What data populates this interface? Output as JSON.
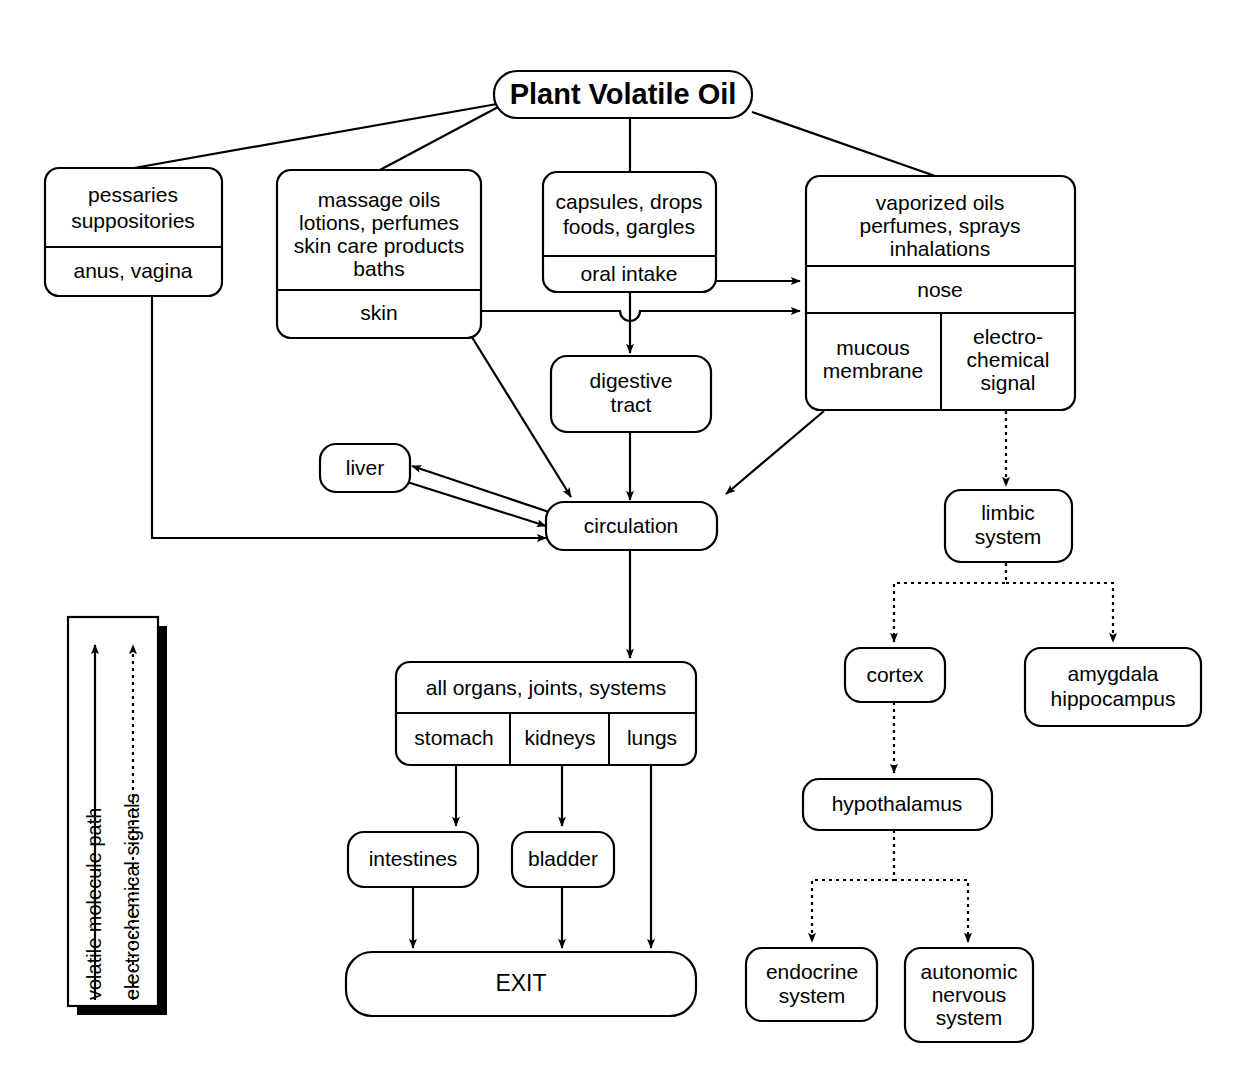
{
  "title": "Plant Volatile Oil",
  "nodes": {
    "root": {
      "label": "Plant Volatile Oil"
    },
    "pessaries": {
      "line1": "pessaries",
      "line2": "suppositories",
      "route": "anus, vagina"
    },
    "massage": {
      "line1": "massage oils",
      "line2": "lotions, perfumes",
      "line3": "skin care products",
      "line4": "baths",
      "route": "skin"
    },
    "capsules": {
      "line1": "capsules, drops",
      "line2": "foods, gargles",
      "route": "oral intake"
    },
    "vaporized": {
      "line1": "vaporized oils",
      "line2": "perfumes, sprays",
      "line3": "inhalations",
      "route": "nose",
      "sub_left1": "mucous",
      "sub_left2": "membrane",
      "sub_right1": "electro-",
      "sub_right2": "chemical",
      "sub_right3": "signal"
    },
    "digestive": {
      "line1": "digestive",
      "line2": "tract"
    },
    "liver": {
      "label": "liver"
    },
    "circulation": {
      "label": "circulation"
    },
    "organs": {
      "header": "all organs, joints, systems",
      "col1": "stomach",
      "col2": "kidneys",
      "col3": "lungs"
    },
    "intestines": {
      "label": "intestines"
    },
    "bladder": {
      "label": "bladder"
    },
    "exit": {
      "label": "EXIT"
    },
    "limbic": {
      "line1": "limbic",
      "line2": "system"
    },
    "cortex": {
      "label": "cortex"
    },
    "amygdala": {
      "line1": "amygdala",
      "line2": "hippocampus"
    },
    "hypothalamus": {
      "label": "hypothalamus"
    },
    "endocrine": {
      "line1": "endocrine",
      "line2": "system"
    },
    "autonomic": {
      "line1": "autonomic",
      "line2": "nervous",
      "line3": "system"
    }
  },
  "legend": {
    "solid_label": "volatile molecule path",
    "dotted_label": "electrochemical signals"
  },
  "colors": {
    "stroke": "#000000",
    "fill": "#ffffff",
    "background": "#ffffff"
  }
}
